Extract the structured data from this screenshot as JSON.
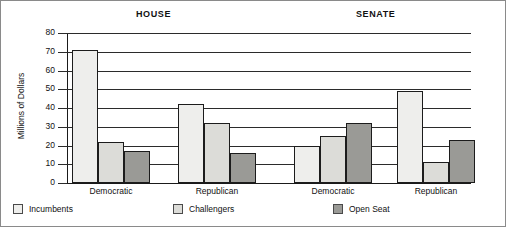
{
  "chart_data": {
    "type": "bar",
    "title": "",
    "panels": [
      "HOUSE",
      "SENATE"
    ],
    "categories": [
      "Democratic",
      "Republican",
      "Democratic",
      "Republican"
    ],
    "group_labels": [
      {
        "panel": "HOUSE",
        "category": "Democratic"
      },
      {
        "panel": "HOUSE",
        "category": "Republican"
      },
      {
        "panel": "SENATE",
        "category": "Democratic"
      },
      {
        "panel": "SENATE",
        "category": "Republican"
      }
    ],
    "series": [
      {
        "name": "Incumbents",
        "color": "#eeeeec",
        "values": [
          71,
          42,
          20,
          49
        ]
      },
      {
        "name": "Challengers",
        "color": "#dcdcd8",
        "values": [
          22,
          32,
          25,
          11
        ]
      },
      {
        "name": "Open Seat",
        "color": "#9a9a96",
        "values": [
          17,
          16,
          32,
          23
        ]
      }
    ],
    "xlabel": "",
    "ylabel": "Millions of Dollars",
    "ylim": [
      0,
      80
    ],
    "ytick_step": 10,
    "yticks": [
      80,
      70,
      60,
      50,
      40,
      30,
      20,
      10,
      0
    ],
    "ytick_labels": [
      "80",
      "70",
      "60",
      "50",
      "40",
      "30",
      "20",
      "10",
      "0"
    ],
    "grid": "horizontal",
    "legend_position": "bottom"
  },
  "titles": {
    "house": "HOUSE",
    "senate": "SENATE"
  },
  "axis": {
    "y_title": "Millions of Dollars"
  },
  "legend": {
    "items": [
      {
        "label": "Incumbents",
        "swatch": "legend-swatch-incumbents"
      },
      {
        "label": "Challengers",
        "swatch": "legend-swatch-challengers"
      },
      {
        "label": "Open Seat",
        "swatch": "legend-swatch-open-seat"
      }
    ]
  }
}
